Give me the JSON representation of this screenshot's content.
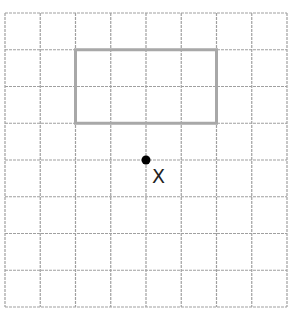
{
  "diagram": {
    "grid": {
      "columns": 8,
      "rows": 8,
      "origin_x": 5,
      "origin_y": 13,
      "cell_width": 35.25,
      "cell_height": 36.75,
      "line_color": "#a0a0a0",
      "line_style": "dashed"
    },
    "rectangle": {
      "col_start": 2,
      "row_start": 1,
      "col_end": 6,
      "row_end": 3,
      "width_cells": 4,
      "height_cells": 2,
      "stroke_color": "#a8a8a8",
      "stroke_width": 3
    },
    "point": {
      "col": 4,
      "row": 4,
      "label": "X",
      "color": "#000000"
    }
  }
}
